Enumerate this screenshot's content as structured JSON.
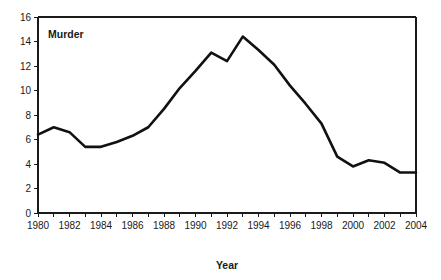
{
  "chart_data": {
    "type": "line",
    "title": "",
    "xlabel": "Year",
    "ylabel": "",
    "series_label": "Murder",
    "grid": false,
    "legend_position": "inside-top-left",
    "xlim": [
      1980,
      2004
    ],
    "ylim": [
      0,
      16
    ],
    "y_ticks": [
      0,
      2,
      4,
      6,
      8,
      10,
      12,
      14,
      16
    ],
    "y_tick_labels": [
      "0",
      "2",
      "4",
      "6",
      "8",
      "10",
      "12",
      "14",
      "16"
    ],
    "x_ticks": [
      1980,
      1981,
      1982,
      1983,
      1984,
      1985,
      1986,
      1987,
      1988,
      1989,
      1990,
      1991,
      1992,
      1993,
      1994,
      1995,
      1996,
      1997,
      1998,
      1999,
      2000,
      2001,
      2002,
      2003,
      2004
    ],
    "x_tick_labels": [
      "1980",
      "",
      "1982",
      "",
      "1984",
      "",
      "1986",
      "",
      "1988",
      "",
      "1990",
      "",
      "1992",
      "",
      "1994",
      "",
      "1996",
      "",
      "1998",
      "",
      "2000",
      "",
      "2002",
      "",
      "2004"
    ],
    "x": [
      1980,
      1981,
      1982,
      1983,
      1984,
      1985,
      1986,
      1987,
      1988,
      1989,
      1990,
      1991,
      1992,
      1993,
      1994,
      1995,
      1996,
      1997,
      1998,
      1999,
      2000,
      2001,
      2002,
      2003,
      2004
    ],
    "values": [
      6.4,
      7.0,
      6.6,
      5.4,
      5.4,
      5.8,
      6.3,
      7.0,
      8.5,
      10.2,
      11.6,
      13.1,
      12.4,
      14.4,
      13.3,
      12.1,
      10.4,
      8.9,
      7.3,
      4.6,
      3.8,
      4.3,
      4.1,
      3.3,
      3.3
    ],
    "line_color": "#111111",
    "axis_color": "#1a1a1a",
    "background_color": "#ffffff"
  },
  "labels": {
    "series_name": "Murder",
    "x_axis_title": "Year"
  }
}
